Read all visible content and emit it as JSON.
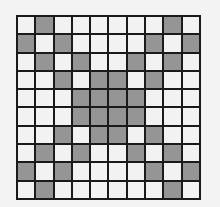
{
  "diagram": {
    "type": "grid-pattern",
    "rows": 10,
    "cols": 10,
    "colors": {
      "filled": "#9a9a9a",
      "empty": "#f2f2f2",
      "lines": "#1a1a1a",
      "background": "#f3f3f3"
    },
    "cells": [
      [
        0,
        1,
        0,
        0,
        0,
        0,
        0,
        0,
        1,
        0
      ],
      [
        1,
        0,
        1,
        0,
        0,
        0,
        0,
        1,
        0,
        1
      ],
      [
        0,
        1,
        0,
        1,
        0,
        0,
        1,
        0,
        1,
        0
      ],
      [
        0,
        0,
        1,
        0,
        1,
        1,
        0,
        1,
        0,
        0
      ],
      [
        0,
        0,
        0,
        1,
        1,
        1,
        1,
        0,
        0,
        0
      ],
      [
        0,
        0,
        0,
        1,
        1,
        1,
        1,
        0,
        0,
        0
      ],
      [
        0,
        0,
        1,
        0,
        1,
        1,
        0,
        1,
        0,
        0
      ],
      [
        0,
        1,
        0,
        1,
        0,
        0,
        1,
        0,
        1,
        0
      ],
      [
        1,
        0,
        1,
        0,
        0,
        0,
        0,
        1,
        0,
        1
      ],
      [
        0,
        1,
        0,
        0,
        0,
        0,
        0,
        0,
        1,
        0
      ]
    ]
  }
}
